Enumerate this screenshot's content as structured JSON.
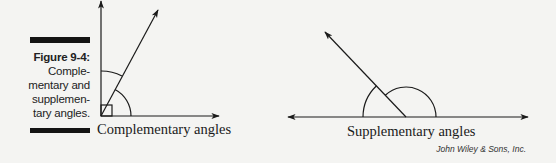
{
  "caption": {
    "figure_label": "Figure 9-4:",
    "lines": [
      "Comple-",
      "mentary and",
      "supplemen-",
      "tary angles."
    ]
  },
  "diagrams": {
    "complementary": {
      "label": "Complementary angles",
      "vertex": [
        101,
        116
      ],
      "rays": [
        "vertical-up",
        "diagonal-60deg",
        "horizontal-right"
      ],
      "right_angle_marker": true
    },
    "supplementary": {
      "label": "Supplementary angles",
      "vertex": [
        406,
        117
      ],
      "rays": [
        "horizontal-left",
        "diagonal-135deg",
        "horizontal-right"
      ]
    }
  },
  "credit": "John Wiley & Sons, Inc.",
  "colors": {
    "ink": "#1a1a1a",
    "background": "#f4f4f2"
  }
}
